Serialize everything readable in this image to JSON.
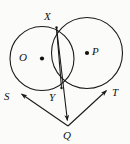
{
  "figure": {
    "background_color": "#fbfbfa",
    "stroke_color": "#1a1a1a",
    "canvas": {
      "width": 130,
      "height": 144
    }
  },
  "labels": {
    "center_o": "O",
    "center_p": "P",
    "point_x": "X",
    "point_y": "Y",
    "point_s": "S",
    "point_t": "T",
    "point_q": "Q"
  },
  "geometry": {
    "circle_o": {
      "cx": 42,
      "cy": 58.5,
      "r": 32
    },
    "circle_p": {
      "cx": 87,
      "cy": 53,
      "r": 35.5
    },
    "center_dot_o": {
      "cx": 42,
      "cy": 58.5,
      "r": 2.1
    },
    "center_dot_p": {
      "cx": 87,
      "cy": 53,
      "r": 2.1
    },
    "point_x": {
      "x": 56.5,
      "y": 27.5
    },
    "point_y": {
      "x": 61.5,
      "y": 88
    },
    "point_s": {
      "x": 16.5,
      "y": 90.5
    },
    "point_t": {
      "x": 110.5,
      "y": 87
    },
    "point_q": {
      "x": 68,
      "y": 126
    },
    "segments": [
      {
        "name": "chord-xy",
        "x1": 56.5,
        "y1": 27.5,
        "x2": 61.5,
        "y2": 88
      },
      {
        "name": "line-x-to-q",
        "x1": 56.5,
        "y1": 27.5,
        "x2": 68,
        "y2": 126
      },
      {
        "name": "tangent-q-to-s",
        "x1": 68,
        "y1": 126,
        "x2": 16.5,
        "y2": 90.5
      },
      {
        "name": "tangent-q-to-t",
        "x1": 68,
        "y1": 126,
        "x2": 110.5,
        "y2": 87
      }
    ],
    "arrow_targets": [
      "S",
      "T",
      "Q"
    ]
  },
  "label_positions": {
    "center_o": {
      "left": 19,
      "top": 52
    },
    "center_p": {
      "left": 92,
      "top": 46
    },
    "point_x": {
      "left": 44,
      "top": 11
    },
    "point_y": {
      "left": 49,
      "top": 92
    },
    "point_s": {
      "left": 4,
      "top": 91
    },
    "point_t": {
      "left": 112,
      "top": 87
    },
    "point_q": {
      "left": 63,
      "top": 130
    }
  }
}
